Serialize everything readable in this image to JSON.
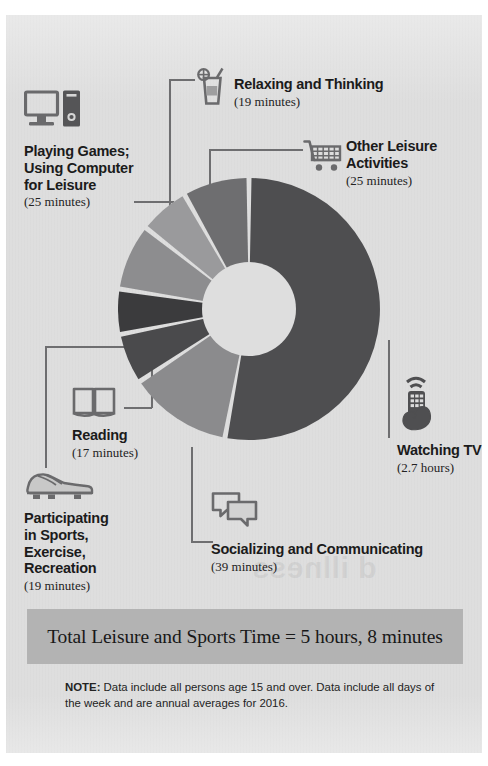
{
  "chart_data": {
    "type": "pie",
    "variant": "donut",
    "units": "minutes per day",
    "total_label": "Total Leisure and Sports Time = 5 hours, 8 minutes",
    "total_minutes": 308,
    "categories": [
      "Watching TV",
      "Socializing and Communicating",
      "Participating in Sports, Exercise, Recreation",
      "Reading",
      "Playing Games; Using Computer for Leisure",
      "Relaxing and Thinking",
      "Other Leisure Activities"
    ],
    "values": [
      162,
      39,
      19,
      17,
      25,
      19,
      25
    ],
    "value_labels": [
      "2.7 hours",
      "39 minutes",
      "19 minutes",
      "17 minutes",
      "25 minutes",
      "19 minutes",
      "25 minutes"
    ],
    "colors": [
      "#4e4e50",
      "#8b8b8d",
      "#4a4a4c",
      "#3b3b3d",
      "#8d8d8f",
      "#9a9a9c",
      "#6e6e70"
    ],
    "legend": "callout labels with icons",
    "grid": false
  },
  "chart": {
    "segments": [
      {
        "name": "Watching TV",
        "value": 162,
        "value_label": "2.7 hours",
        "color": "#4e4e50"
      },
      {
        "name": "Socializing and Communicating",
        "value": 39,
        "value_label": "39 minutes",
        "color": "#8b8b8d"
      },
      {
        "name": "Participating in Sports, Exercise, Recreation",
        "value": 19,
        "value_label": "19 minutes",
        "color": "#4a4a4c"
      },
      {
        "name": "Reading",
        "value": 17,
        "value_label": "17 minutes",
        "color": "#3b3b3d"
      },
      {
        "name": "Playing Games; Using Computer for Leisure",
        "value": 25,
        "value_label": "25 minutes",
        "color": "#8d8d8f"
      },
      {
        "name": "Relaxing and Thinking",
        "value": 19,
        "value_label": "19 minutes",
        "color": "#9a9a9c"
      },
      {
        "name": "Other Leisure Activities",
        "value": 25,
        "value_label": "25 minutes",
        "color": "#6e6e70"
      }
    ],
    "background": "#dedede",
    "gap_color": "#dedede"
  },
  "labels": {
    "playing_games": {
      "title_line1": "Playing Games;",
      "title_line2": "Using Computer",
      "title_line3": "for Leisure",
      "value": "(25 minutes)",
      "icon": "desktop-computer-icon"
    },
    "relaxing": {
      "title": "Relaxing and Thinking",
      "value": "(19 minutes)",
      "icon": "drink-glass-icon"
    },
    "other_leisure": {
      "title_line1": "Other Leisure",
      "title_line2": "Activities",
      "value": "(25 minutes)",
      "icon": "shopping-cart-icon"
    },
    "watching_tv": {
      "title": "Watching TV",
      "value": "(2.7 hours)",
      "icon": "tv-remote-hand-icon"
    },
    "socializing": {
      "title": "Socializing and Communicating",
      "value": "(39 minutes)",
      "icon": "speech-bubbles-icon"
    },
    "reading": {
      "title": "Reading",
      "value": "(17 minutes)",
      "icon": "open-book-icon"
    },
    "sports": {
      "title_line1": "Participating",
      "title_line2": "in Sports,",
      "title_line3": "Exercise,",
      "title_line4": "Recreation",
      "value": "(19 minutes)",
      "icon": "sport-shoe-icon"
    }
  },
  "total": {
    "text": "Total Leisure and Sports Time = 5 hours, 8 minutes"
  },
  "note": {
    "prefix": "NOTE:",
    "text": " Data include all persons age 15 and over. Data include all days of the week and are annual averages for 2016."
  },
  "watermark": {
    "text": "d illness"
  }
}
